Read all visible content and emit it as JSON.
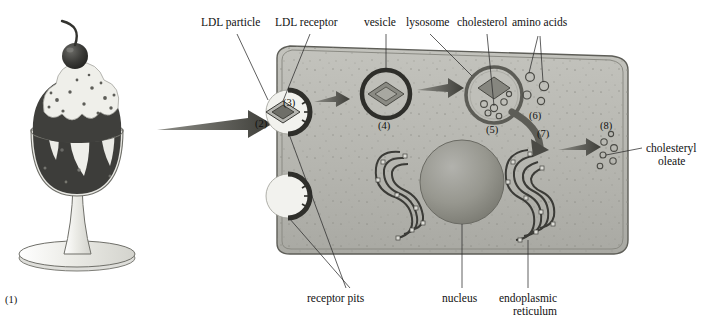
{
  "figure": {
    "background_color": "#ffffff",
    "cell_fill": "#b9b9b4",
    "membrane_color": "#6f6f68",
    "organelle_dark": "#4a4a46",
    "arrow_color": "#5a5a55",
    "sundae_dark": "#3f3f3f",
    "sundae_cream": "#efefea"
  },
  "labels": {
    "ldl_particle": "LDL particle",
    "ldl_receptor": "LDL receptor",
    "vesicle": "vesicle",
    "lysosome": "lysosome",
    "cholesterol": "cholesterol",
    "amino_acids": "amino acids",
    "cholesteryl_oleate_line1": "cholesteryl",
    "cholesteryl_oleate_line2": "oleate",
    "receptor_pits": "receptor pits",
    "nucleus": "nucleus",
    "endoplasmic_line1": "endoplasmic",
    "endoplasmic_line2": "reticulum"
  },
  "step_numbers": {
    "n1": "(1)",
    "n2": "(2)",
    "n3": "(3)",
    "n4": "(4)",
    "n5": "(5)",
    "n6": "(6)",
    "n7": "(7)",
    "n8": "(8)"
  },
  "steps": [
    {
      "id": "(1)",
      "name": "dietary-cholesterol-sundae",
      "description": "ice cream sundae in a glass goblet"
    },
    {
      "id": "(2)",
      "name": "ldl-particle",
      "description": "LDL particle diamond at cell surface"
    },
    {
      "id": "(3)",
      "name": "receptor-pit-upper",
      "description": "coated receptor pit binding LDL"
    },
    {
      "id": "(4)",
      "name": "vesicle",
      "description": "endocytic vesicle containing LDL"
    },
    {
      "id": "(5)",
      "name": "lysosome",
      "description": "lysosome degrading LDL to cholesterol and amino acids"
    },
    {
      "id": "(6)",
      "name": "amino-acids",
      "description": "released amino acids"
    },
    {
      "id": "(7)",
      "name": "endoplasmic-reticulum",
      "description": "endoplasmic reticulum esterifying cholesterol"
    },
    {
      "id": "(8)",
      "name": "cholesteryl-oleate",
      "description": "stored cholesteryl oleate droplets"
    }
  ]
}
